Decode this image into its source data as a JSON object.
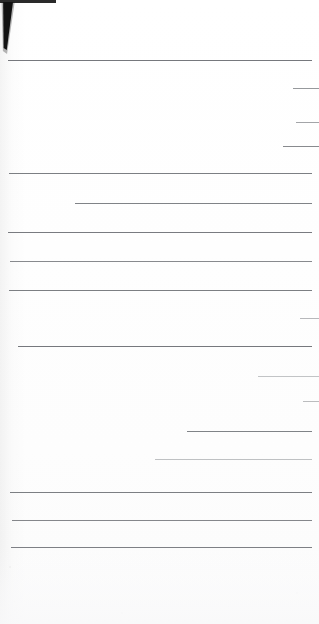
{
  "document": {
    "kind": "scanned-ruled-page",
    "page_label": "",
    "background_color": "#ffffff",
    "rule_color": "#6a6d72",
    "width_px": 319,
    "height_px": 624,
    "text_content": "",
    "notes": "Blank scanned sheet of ruled paper; no legible text is present in the pixels."
  },
  "artifacts": {
    "top_edge_bar": {
      "x": 0,
      "y": 0,
      "width": 56,
      "height": 3,
      "color": "#2a2a2a"
    },
    "corner_wedge": {
      "x": 1,
      "y": 2,
      "width": 12,
      "height": 48,
      "color": "#111111"
    },
    "binding_shade": {
      "x": 0,
      "y": 0,
      "width": 26,
      "height": 624
    }
  },
  "rules": [
    {
      "id": "rule-01",
      "x": 8,
      "y": 60,
      "width": 304,
      "thickness": 1.2,
      "opacity": 0.92
    },
    {
      "id": "rule-02",
      "x": 293,
      "y": 88,
      "width": 26,
      "thickness": 1.3,
      "opacity": 0.7
    },
    {
      "id": "rule-03",
      "x": 296,
      "y": 122,
      "width": 23,
      "thickness": 1.2,
      "opacity": 0.62
    },
    {
      "id": "rule-04",
      "x": 283,
      "y": 146,
      "width": 36,
      "thickness": 1.4,
      "opacity": 0.8
    },
    {
      "id": "rule-05",
      "x": 9,
      "y": 173,
      "width": 303,
      "thickness": 1.1,
      "opacity": 0.88
    },
    {
      "id": "rule-06",
      "x": 75,
      "y": 203,
      "width": 237,
      "thickness": 1.1,
      "opacity": 0.85
    },
    {
      "id": "rule-07",
      "x": 8,
      "y": 232,
      "width": 304,
      "thickness": 1.1,
      "opacity": 0.9
    },
    {
      "id": "rule-08",
      "x": 10,
      "y": 261,
      "width": 302,
      "thickness": 1.0,
      "opacity": 0.8
    },
    {
      "id": "rule-09",
      "x": 9,
      "y": 290,
      "width": 303,
      "thickness": 1.1,
      "opacity": 0.88
    },
    {
      "id": "rule-10",
      "x": 300,
      "y": 318,
      "width": 19,
      "thickness": 1.1,
      "opacity": 0.48
    },
    {
      "id": "rule-11",
      "x": 18,
      "y": 346,
      "width": 294,
      "thickness": 1.2,
      "opacity": 0.92
    },
    {
      "id": "rule-12",
      "x": 258,
      "y": 376,
      "width": 61,
      "thickness": 1.0,
      "opacity": 0.4
    },
    {
      "id": "rule-13",
      "x": 303,
      "y": 401,
      "width": 16,
      "thickness": 1.1,
      "opacity": 0.45
    },
    {
      "id": "rule-14",
      "x": 187,
      "y": 431,
      "width": 125,
      "thickness": 1.1,
      "opacity": 0.85
    },
    {
      "id": "rule-15",
      "x": 155,
      "y": 459,
      "width": 157,
      "thickness": 1.0,
      "opacity": 0.42
    },
    {
      "id": "rule-16",
      "x": 10,
      "y": 492,
      "width": 302,
      "thickness": 1.1,
      "opacity": 0.88
    },
    {
      "id": "rule-17",
      "x": 12,
      "y": 520,
      "width": 300,
      "thickness": 1.0,
      "opacity": 0.82
    },
    {
      "id": "rule-18",
      "x": 11,
      "y": 547,
      "width": 301,
      "thickness": 1.2,
      "opacity": 0.9
    }
  ],
  "specks": [
    {
      "x": 9,
      "y": 566,
      "size": 2.0,
      "opacity": 0.3
    },
    {
      "x": 14,
      "y": 601,
      "size": 1.4,
      "opacity": 0.18
    },
    {
      "x": 121,
      "y": 612,
      "size": 1.6,
      "opacity": 0.14
    },
    {
      "x": 228,
      "y": 606,
      "size": 1.3,
      "opacity": 0.12
    },
    {
      "x": 296,
      "y": 592,
      "size": 1.5,
      "opacity": 0.13
    }
  ]
}
